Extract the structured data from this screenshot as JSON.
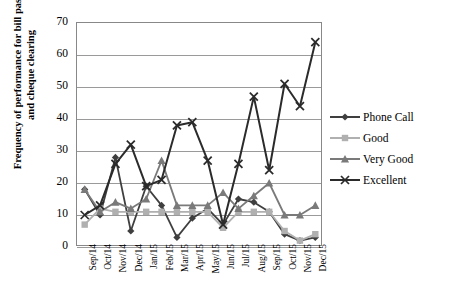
{
  "chart_data": {
    "type": "line",
    "title": "",
    "xlabel": "",
    "ylabel": "Frequency of performance for bill passing and cheque clearing",
    "ylabel_line1": "Frequency of performance for bill passing",
    "ylabel_line2": "and cheque clearing",
    "ylim": [
      0,
      70
    ],
    "ytick_step": 10,
    "yticks": [
      0,
      10,
      20,
      30,
      40,
      50,
      60,
      70
    ],
    "grid": true,
    "legend_position": "right",
    "categories": [
      "Sep/14",
      "Oct/14",
      "Nov/14",
      "Dec/14",
      "Jan/15",
      "Feb/15",
      "Mar/15",
      "Apr/15",
      "May/15",
      "Jun/15",
      "Jul/15",
      "Aug/15",
      "Sep/15",
      "Oct/15",
      "Nov/15",
      "Dec/15"
    ],
    "series": [
      {
        "name": "Phone Call",
        "marker": "diamond",
        "color": "#3f3f3f",
        "values": [
          18,
          10,
          28,
          5,
          19,
          13,
          3,
          9,
          12,
          7,
          15,
          14,
          11,
          4,
          2,
          3
        ]
      },
      {
        "name": "Good",
        "marker": "square",
        "color": "#b0b0b0",
        "values": [
          7,
          12,
          11,
          11,
          11,
          11,
          11,
          11,
          11,
          6,
          11,
          11,
          11,
          5,
          2,
          4
        ]
      },
      {
        "name": "Very Good",
        "marker": "triangle",
        "color": "#7a7a7a",
        "values": [
          18,
          11,
          14,
          12,
          15,
          27,
          13,
          13,
          13,
          17,
          12,
          16,
          20,
          10,
          10,
          13
        ]
      },
      {
        "name": "Excellent",
        "marker": "cross",
        "color": "#2b2b2b",
        "values": [
          10,
          13,
          26,
          32,
          19,
          21,
          38,
          39,
          27,
          7,
          26,
          47,
          24,
          51,
          44,
          64
        ]
      }
    ]
  },
  "legend": {
    "items": [
      {
        "label": "Phone Call"
      },
      {
        "label": "Good"
      },
      {
        "label": "Very Good"
      },
      {
        "label": "Excellent"
      }
    ]
  }
}
